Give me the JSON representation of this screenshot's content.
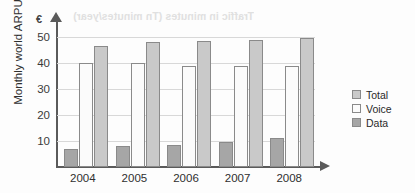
{
  "artifacts": {
    "bleed_text_top": "Traffic in minutes (Tn minutes/year)",
    "bleed_text_bottom": "reverse page bleed"
  },
  "chart_data": {
    "type": "bar",
    "title": "",
    "xlabel": "",
    "ylabel": "Monthly world ARPU",
    "y_unit_symbol": "€",
    "categories": [
      "2004",
      "2005",
      "2006",
      "2007",
      "2008"
    ],
    "series": [
      {
        "name": "Total",
        "values": [
          46.5,
          48,
          48.5,
          49,
          49.5
        ]
      },
      {
        "name": "Voice",
        "values": [
          40,
          40,
          39,
          39,
          39
        ]
      },
      {
        "name": "Data",
        "values": [
          7,
          8,
          8.5,
          9.5,
          11
        ]
      }
    ],
    "bar_order_in_group": [
      "Data",
      "Voice",
      "Total"
    ],
    "ylim": [
      0,
      55
    ],
    "yticks": [
      10,
      20,
      30,
      40,
      50
    ],
    "ytick_labels": [
      "10",
      "20",
      "30",
      "40",
      "50"
    ],
    "grid": true,
    "legend_position": "right",
    "colors": {
      "total": "#c9c9c9",
      "voice": "#fbfbfb",
      "data": "#a6a6a6",
      "axis": "#5a5a5a",
      "grid": "#d8d8d8"
    }
  },
  "legend": {
    "items": [
      {
        "label": "Total",
        "key": "total"
      },
      {
        "label": "Voice",
        "key": "voice"
      },
      {
        "label": "Data",
        "key": "data"
      }
    ]
  }
}
